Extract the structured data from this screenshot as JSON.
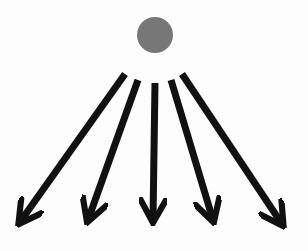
{
  "diagram": {
    "source": {
      "cx": 155,
      "cy": 35,
      "r": 18,
      "color": "#777777"
    },
    "arrow_color": "#111111",
    "arrows": [
      {
        "x1": 125,
        "y1": 74,
        "x2": 20,
        "y2": 222
      },
      {
        "x1": 138,
        "y1": 80,
        "x2": 88,
        "y2": 220
      },
      {
        "x1": 155,
        "y1": 83,
        "x2": 153,
        "y2": 220
      },
      {
        "x1": 171,
        "y1": 80,
        "x2": 213,
        "y2": 220
      },
      {
        "x1": 182,
        "y1": 74,
        "x2": 282,
        "y2": 224
      }
    ]
  }
}
